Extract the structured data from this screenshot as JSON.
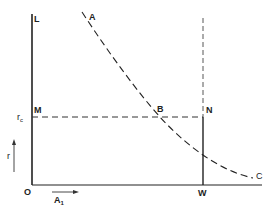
{
  "diagram": {
    "type": "economic-curve-diagram",
    "colors": {
      "line": "#222222",
      "background": "#ffffff"
    },
    "labels": {
      "L": "L",
      "A": "A",
      "M": "M",
      "B": "B",
      "N": "N",
      "r_c_main": "r",
      "r_c_sub": "c",
      "r": "r",
      "O": "O",
      "A1_main": "A",
      "A1_sub": "1",
      "W": "W",
      "C": "C"
    },
    "elements": {
      "y_axis": "solid vertical line O–L",
      "x_axis": "solid horizontal line from O",
      "curve_AC": "dashed downward-sloping convex curve from A through B to C",
      "line_MN": "dashed horizontal line at r_c from M to N",
      "line_WN": "solid vertical line from W up to N, continuing dashed above N",
      "arrow_r": "upward arrow beside r label",
      "arrow_A1": "rightward arrow above A1 label"
    }
  }
}
